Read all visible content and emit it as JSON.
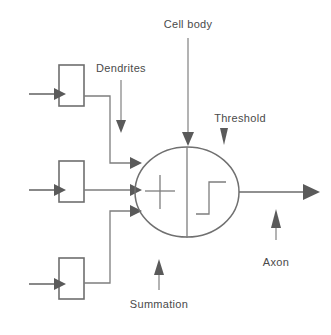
{
  "diagram": {
    "background_color": "#ffffff",
    "line_color": "#6b6b6b",
    "text_color": "#4a4a4a",
    "labels": {
      "cell_body": "Cell body",
      "dendrites": "Dendrites",
      "threshold": "Threshold",
      "summation": "Summation",
      "axon": "Axon"
    },
    "symbols": {
      "summation_symbol": "+",
      "threshold_symbol": "step-function"
    },
    "inputs": [
      {
        "id": "input-1",
        "position": "top"
      },
      {
        "id": "input-2",
        "position": "middle"
      },
      {
        "id": "input-3",
        "position": "bottom"
      }
    ],
    "output": {
      "id": "axon-output",
      "direction": "right"
    },
    "icon_names": {
      "input_arrow": "arrow-right-icon",
      "dendrite_arrow": "arrow-right-icon",
      "output_arrow": "arrow-right-icon",
      "cell_body_pointer": "arrow-down-icon",
      "dendrites_pointer": "arrow-down-icon",
      "threshold_pointer": "arrow-down-icon",
      "summation_pointer": "arrow-up-icon",
      "axon_pointer": "arrow-up-icon"
    }
  }
}
